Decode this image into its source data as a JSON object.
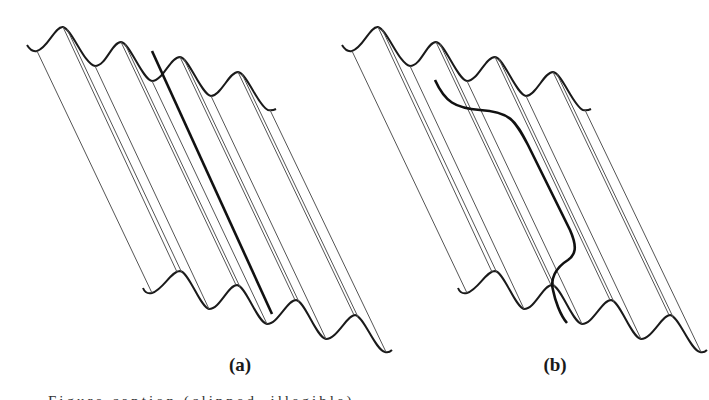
{
  "figure": {
    "panels": [
      {
        "id": "a",
        "label": "(a)",
        "label_x": 240,
        "offset_x": 0,
        "highlight": "straight-line along ridge",
        "highlight_path": "M 152 51 L 272 314"
      },
      {
        "id": "b",
        "label": "(b)",
        "label_x": 555,
        "offset_x": 315,
        "highlight": "curved path crossing one ridge",
        "highlight_path": "M 435 80 C 445 102, 455 108, 480 110 C 510 112, 515 120, 528 145 L 570 230 C 578 248, 575 255, 568 260 C 555 268, 550 280, 553 290 C 555 300, 560 315, 567 323"
      }
    ],
    "caption": "Figure caption (clipped, illegible)",
    "colors": {
      "wave": "#1a1a1a",
      "ridge_line": "#555555",
      "highlight": "#111111",
      "background": "#ffffff"
    }
  }
}
